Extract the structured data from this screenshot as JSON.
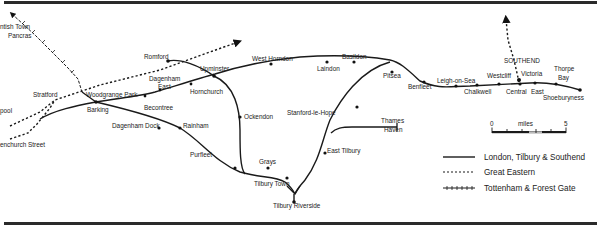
{
  "map": {
    "title": "",
    "stations": {
      "kentish_town": "ntish Town",
      "st_pancras": "Pancras",
      "liverpool_street": "pool",
      "fenchurch_street": "enchurch Street",
      "stratford": "Stratford",
      "woodgrange_park": "Woodgrange Park",
      "barking": "Barking",
      "romford": "Romford",
      "dagenham_east_1": "Dagenham",
      "dagenham_east_2": "East",
      "becontree": "Becontree",
      "hornchurch": "Hornchurch",
      "upminster": "Upminster",
      "dagenham_dock": "Dagenham Dock",
      "rainham": "Rainham",
      "purfleet": "Purfleet",
      "ockendon": "Ockendon",
      "grays": "Grays",
      "tilbury_town": "Tilbury Town",
      "tilbury_riverside": "Tilbury Riverside",
      "west_horndon": "West Horndon",
      "laindon": "Laindon",
      "basildon": "Basildon",
      "stanford_le_hope": "Stanford-le-Hope",
      "east_tilbury": "East Tilbury",
      "thames_haven_1": "Thames",
      "thames_haven_2": "Haven",
      "pitsea": "Pitsea",
      "benfleet": "Benfleet",
      "leigh_on_sea": "Leigh-on-Sea",
      "chalkwell": "Chalkwell",
      "westcliff": "Westcliff",
      "southend": "SOUTHEND",
      "victoria": "Victoria",
      "central": "Central",
      "east": "East",
      "thorpe_bay_1": "Thorpe",
      "thorpe_bay_2": "Bay",
      "shoeburyness": "Shoeburyness"
    },
    "scale": {
      "start": "0",
      "unit": "miles",
      "end": "5"
    },
    "legend": [
      {
        "style": "solid",
        "label": "London, Tilbury & Southend"
      },
      {
        "style": "dashed",
        "label": "Great Eastern"
      },
      {
        "style": "crossed",
        "label": "Tottenham & Forest Gate"
      }
    ],
    "colors": {
      "line": "#1a1a1a",
      "background": "#ffffff",
      "text": "#222222"
    }
  }
}
